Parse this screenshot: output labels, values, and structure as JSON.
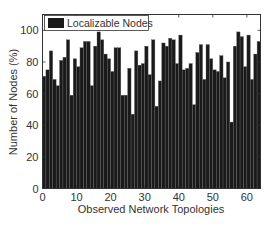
{
  "chart_data": {
    "type": "bar",
    "title": "",
    "xlabel": "Observed Network Topologies",
    "ylabel": "Number of Nodes (%)",
    "xlim": [
      0,
      64
    ],
    "ylim": [
      0,
      110
    ],
    "xticks": [
      0,
      10,
      20,
      30,
      40,
      50,
      60
    ],
    "yticks": [
      0,
      20,
      40,
      60,
      80,
      100
    ],
    "grid": false,
    "legend_position": "top-left",
    "series": [
      {
        "name": "Localizable Nodes",
        "color": "#1a1a1a",
        "x": [
          1,
          2,
          3,
          4,
          5,
          6,
          7,
          8,
          9,
          10,
          11,
          12,
          13,
          14,
          15,
          16,
          17,
          18,
          19,
          20,
          21,
          22,
          23,
          24,
          25,
          26,
          27,
          28,
          29,
          30,
          31,
          32,
          33,
          34,
          35,
          36,
          37,
          38,
          39,
          40,
          41,
          42,
          43,
          44,
          45,
          46,
          47,
          48,
          49,
          50,
          51,
          52,
          53,
          54,
          55,
          56,
          57,
          58,
          59,
          60,
          61,
          62,
          63,
          64
        ],
        "values": [
          71,
          75,
          87,
          69,
          65,
          81,
          83,
          94,
          59,
          82,
          77,
          89,
          93,
          93,
          65,
          90,
          99,
          94,
          85,
          82,
          74,
          89,
          89,
          59,
          59,
          76,
          47,
          87,
          78,
          79,
          90,
          72,
          94,
          52,
          68,
          92,
          90,
          95,
          94,
          79,
          97,
          75,
          76,
          79,
          53,
          86,
          91,
          69,
          91,
          82,
          75,
          74,
          84,
          70,
          80,
          42,
          90,
          99,
          96,
          77,
          97,
          69,
          85,
          93
        ]
      }
    ]
  },
  "axes": {
    "xlabel": "Observed Network Topologies",
    "ylabel": "Number of Nodes (%)",
    "xtick_labels": [
      "0",
      "10",
      "20",
      "30",
      "40",
      "50",
      "60"
    ],
    "ytick_labels": [
      "0",
      "20",
      "40",
      "60",
      "80",
      "100"
    ]
  },
  "legend": {
    "label": "Localizable Nodes",
    "swatch_color": "#1a1a1a"
  }
}
